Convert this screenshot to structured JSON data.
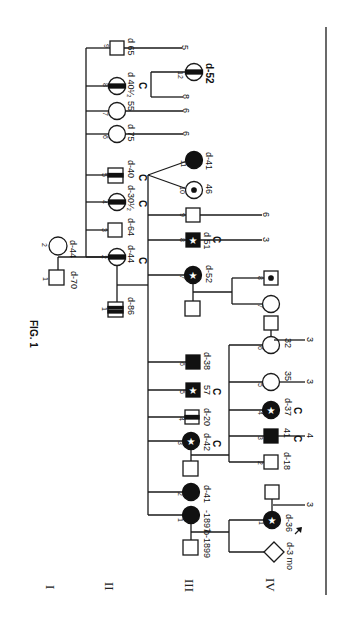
{
  "figure": {
    "title": "FIG. 1",
    "orientation": "rotated 90° clockwise",
    "generations": [
      "I",
      "II",
      "III",
      "IV"
    ],
    "legend_symbols": {
      "square": "male",
      "circle": "female",
      "diamond": "sex unknown",
      "filled": "affected",
      "star": "affected (star marker)",
      "bar": "carrier / partial (horizontal band)",
      "dot": "dot in center",
      "arrow": "proband"
    }
  },
  "individuals": {
    "I1": {
      "num": "1",
      "label": "d-70"
    },
    "I2": {
      "num": "2",
      "label": "d-44"
    },
    "II1": {
      "num": "1",
      "label": "d-86"
    },
    "II2": {
      "num": "2",
      "label": "d-44",
      "sub": "C"
    },
    "II3": {
      "num": "3",
      "label": "d-64"
    },
    "II4": {
      "num": "4",
      "label": "d-30¹⁄₂",
      "sub": "C"
    },
    "II5": {
      "num": "5",
      "label": "d-40",
      "sub": "C"
    },
    "II6": {
      "num": "6",
      "label": "d 75",
      "offspring": "6"
    },
    "II7": {
      "num": "7",
      "label": "55",
      "offspring": "6"
    },
    "II8": {
      "num": "8",
      "label": "d 40¹⁄₂",
      "sub": "C",
      "offspring": "8"
    },
    "II9": {
      "num": "9",
      "label": "d 65",
      "offspring": "5"
    },
    "III1": {
      "num": "1",
      "label": "-1897",
      "sp_label": "b-1899"
    },
    "III2": {
      "num": "2",
      "label": "d-41"
    },
    "III3": {
      "num": "3",
      "label": "d-42",
      "sub": "C"
    },
    "III4": {
      "num": "4",
      "label": "d-20"
    },
    "III5": {
      "num": "5",
      "label": "57",
      "sub": "C"
    },
    "III6": {
      "num": "6",
      "label": "d-38"
    },
    "III7": {
      "num": "7",
      "label": "d-52"
    },
    "III8": {
      "num": "8",
      "label": "d 51",
      "sub": "C",
      "offspring": "3"
    },
    "III9": {
      "num": "9",
      "label": "",
      "offspring": "6"
    },
    "III10": {
      "num": "10",
      "label": "46"
    },
    "III11": {
      "num": "11",
      "label": "d-41"
    },
    "III12": {
      "num": "12",
      "label": "d-52"
    },
    "IV1": {
      "num": "1",
      "label": "d-36",
      "offspring": "3"
    },
    "IV1b": {
      "label": "d-3 mo"
    },
    "IV2": {
      "num": "2",
      "label": "d-18"
    },
    "IV3": {
      "num": "3",
      "label": "41",
      "sub": "C",
      "offspring": "4"
    },
    "IV4": {
      "num": "4",
      "label": "d-37",
      "sub": "C"
    },
    "IV5": {
      "num": "5",
      "label": "35",
      "offspring": "3"
    },
    "IV6": {
      "num": "6",
      "label": "32",
      "offspring": "3"
    },
    "IV7": {
      "num": "7",
      "label": ""
    },
    "IV8": {
      "num": "8",
      "label": ""
    }
  }
}
